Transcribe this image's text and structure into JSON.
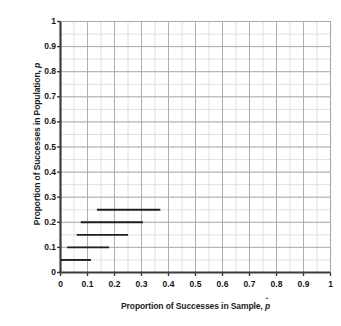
{
  "chart_data": {
    "type": "line",
    "title": "",
    "xlabel": "Proportion of Successes in Sample, p̂",
    "ylabel": "Proportion of Successes in Population, p",
    "xlabel_prefix": "Proportion of Successes in Sample, ",
    "xlabel_symbol": "p",
    "ylabel_prefix": "Proportion of Successes in Population, ",
    "ylabel_symbol": "p",
    "xlim": [
      0,
      1
    ],
    "ylim": [
      0,
      1
    ],
    "xticks": [
      "0",
      "0.1",
      "0.2",
      "0.3",
      "0.4",
      "0.5",
      "0.6",
      "0.7",
      "0.8",
      "0.9",
      "1"
    ],
    "xtick_values": [
      0,
      0.1,
      0.2,
      0.3,
      0.4,
      0.5,
      0.6,
      0.7,
      0.8,
      0.9,
      1
    ],
    "yticks": [
      "0",
      "0.1",
      "0.2",
      "0.3",
      "0.4",
      "0.5",
      "0.6",
      "0.7",
      "0.8",
      "0.9",
      "1"
    ],
    "ytick_values": [
      0,
      0.1,
      0.2,
      0.3,
      0.4,
      0.5,
      0.6,
      0.7,
      0.8,
      0.9,
      1
    ],
    "grid": true,
    "minor_grid": true,
    "minor_grid_step": 0.05,
    "legend": null,
    "series": [
      {
        "name": "interval-p-0.25",
        "y": 0.25,
        "x_start": 0.135,
        "x_end": 0.37
      },
      {
        "name": "interval-p-0.20",
        "y": 0.2,
        "x_start": 0.075,
        "x_end": 0.305
      },
      {
        "name": "interval-p-0.15",
        "y": 0.15,
        "x_start": 0.06,
        "x_end": 0.25
      },
      {
        "name": "interval-p-0.10",
        "y": 0.1,
        "x_start": 0.025,
        "x_end": 0.18
      },
      {
        "name": "interval-p-0.05",
        "y": 0.05,
        "x_start": 0.0,
        "x_end": 0.113
      }
    ]
  },
  "style": {
    "axis_color": "#3c3c3c",
    "grid_major_color": "#a8a8a8",
    "grid_minor_color": "#d8d8d8",
    "series_color": "#1e1e1e",
    "text_color": "#141414",
    "background": "#ffffff"
  }
}
